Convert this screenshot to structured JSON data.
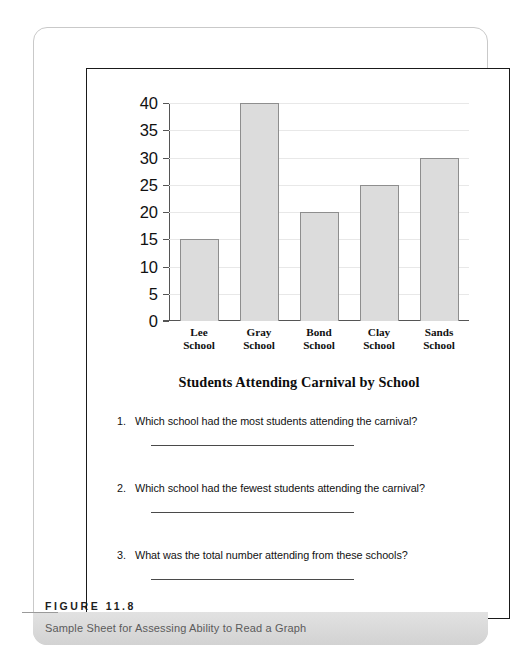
{
  "figure": {
    "number_label": "FIGURE 11.8",
    "caption": "Sample Sheet for Assessing Ability to Read a Graph"
  },
  "chart_data": {
    "type": "bar",
    "title": "Students Attending Carnival by School",
    "xlabel": "",
    "ylabel": "",
    "categories": [
      "Lee School",
      "Gray School",
      "Bond School",
      "Clay School",
      "Sands School"
    ],
    "category_lines": [
      [
        "Lee",
        "School"
      ],
      [
        "Gray",
        "School"
      ],
      [
        "Bond",
        "School"
      ],
      [
        "Clay",
        "School"
      ],
      [
        "Sands",
        "School"
      ]
    ],
    "values": [
      15,
      40,
      20,
      25,
      30
    ],
    "ylim": [
      0,
      40
    ],
    "yticks": [
      0,
      5,
      10,
      15,
      20,
      25,
      30,
      35,
      40
    ],
    "ytick_labels": [
      "0",
      "5",
      "10",
      "15",
      "20",
      "25",
      "30",
      "35",
      "40"
    ],
    "grid": true,
    "legend": false,
    "bar_fill_color": "#dcdcdc",
    "bar_border_color": "#8e8e8e",
    "gridline_color": "#e8e8e8",
    "axis_color": "#555555"
  },
  "worksheet": {
    "questions": [
      {
        "number": "1.",
        "text": "Which school had the most students attending the carnival?"
      },
      {
        "number": "2.",
        "text": "Which school had the fewest students attending the carnival?"
      },
      {
        "number": "3.",
        "text": "What was the total number attending from these schools?"
      }
    ]
  }
}
